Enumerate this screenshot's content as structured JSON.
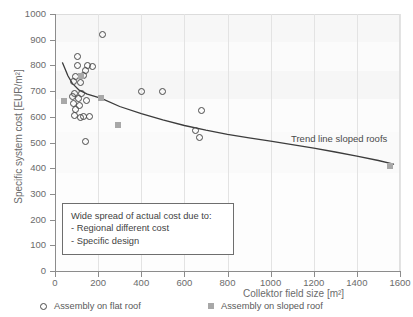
{
  "chart_data": {
    "type": "scatter",
    "title": "",
    "xlabel": "Collektor field size [m²]",
    "ylabel": "Specific system cost [EUR/m²]",
    "xlim": [
      0,
      1600
    ],
    "ylim": [
      0,
      1000
    ],
    "xticks": [
      0,
      200,
      400,
      600,
      800,
      1000,
      1200,
      1400,
      1600
    ],
    "yticks": [
      0,
      100,
      200,
      300,
      400,
      500,
      600,
      700,
      800,
      900,
      1000
    ],
    "grid": "vertical-only",
    "legend_position": "below-axis",
    "series": [
      {
        "name": "Assembly on flat roof",
        "marker": "open-circle",
        "color": "#4a4a4a",
        "points": [
          [
            220,
            920
          ],
          [
            105,
            833
          ],
          [
            103,
            800
          ],
          [
            152,
            800
          ],
          [
            172,
            797
          ],
          [
            140,
            782
          ],
          [
            133,
            760
          ],
          [
            95,
            757
          ],
          [
            88,
            737
          ],
          [
            118,
            733
          ],
          [
            400,
            700
          ],
          [
            500,
            697
          ],
          [
            92,
            692
          ],
          [
            122,
            690
          ],
          [
            83,
            678
          ],
          [
            108,
            672
          ],
          [
            148,
            665
          ],
          [
            86,
            650
          ],
          [
            112,
            645
          ],
          [
            95,
            628
          ],
          [
            680,
            625
          ],
          [
            90,
            607
          ],
          [
            130,
            603
          ],
          [
            160,
            600
          ],
          [
            118,
            598
          ],
          [
            650,
            545
          ],
          [
            668,
            520
          ],
          [
            140,
            505
          ]
        ]
      },
      {
        "name": "Assembly on sloped roof",
        "marker": "filled-square",
        "color": "#a8a8a8",
        "points": [
          [
            40,
            660
          ],
          [
            120,
            760
          ],
          [
            215,
            672
          ],
          [
            290,
            568
          ],
          [
            1555,
            410
          ]
        ]
      }
    ],
    "trend_line": {
      "label": "Trend line sloped roofs",
      "color": "#3c3c3c",
      "points": [
        [
          35,
          810
        ],
        [
          45,
          790
        ],
        [
          60,
          760
        ],
        [
          80,
          730
        ],
        [
          110,
          705
        ],
        [
          150,
          688
        ],
        [
          215,
          672
        ],
        [
          300,
          640
        ],
        [
          400,
          612
        ],
        [
          500,
          588
        ],
        [
          600,
          566
        ],
        [
          700,
          548
        ],
        [
          800,
          532
        ],
        [
          900,
          518
        ],
        [
          1000,
          505
        ],
        [
          1100,
          492
        ],
        [
          1200,
          478
        ],
        [
          1300,
          463
        ],
        [
          1400,
          447
        ],
        [
          1500,
          430
        ],
        [
          1570,
          416
        ]
      ]
    },
    "annotation": {
      "lines": [
        "Wide spread  of actual cost due to:",
        "- Regional different cost",
        "- Specific design"
      ]
    }
  }
}
